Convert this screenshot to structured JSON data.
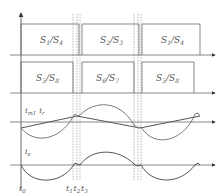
{
  "diagram": {
    "type": "switching-timing-diagram",
    "colors": {
      "line": "#6a6a6a",
      "dash": "#8a8a8a",
      "curve": "#7a7a7a",
      "text": "#555555",
      "background": "#ffffff"
    },
    "rows": [
      {
        "name": "upper-switch-row",
        "pulses": [
          {
            "label_main": "S",
            "sub1": "1",
            "label_sep": "/S",
            "sub2": "4",
            "text": "S1/S4"
          },
          {
            "label_main": "S",
            "sub1": "2",
            "label_sep": "/S",
            "sub2": "3",
            "text": "S2/S3"
          },
          {
            "label_main": "S",
            "sub1": "1",
            "label_sep": "/S",
            "sub2": "4",
            "text": "S1/S4"
          }
        ]
      },
      {
        "name": "lower-switch-row",
        "pulses": [
          {
            "label_main": "S",
            "sub1": "5",
            "label_sep": "/S",
            "sub2": "8",
            "text": "S5/S8"
          },
          {
            "label_main": "S",
            "sub1": "6",
            "label_sep": "/S",
            "sub2": "7",
            "text": "S6/S7"
          },
          {
            "label_main": "S",
            "sub1": "5",
            "label_sep": "/S",
            "sub2": "8",
            "text": "S5/S8"
          }
        ]
      }
    ],
    "waveforms": {
      "current_pair": {
        "label_a_main": "i",
        "label_a_sub": "m1",
        "label_b_main": "i",
        "label_b_sub": "r",
        "text": "im1 ir"
      },
      "secondary": {
        "label_main": "i",
        "label_sub": "s",
        "text": "is"
      }
    },
    "time_markers": [
      {
        "main": "t",
        "sub": "0",
        "text": "t0"
      },
      {
        "main": "t",
        "sub": "1",
        "text": "t1"
      },
      {
        "main": "t",
        "sub": "2",
        "text": "t2"
      },
      {
        "main": "t",
        "sub": "3",
        "text": "t3"
      }
    ]
  }
}
